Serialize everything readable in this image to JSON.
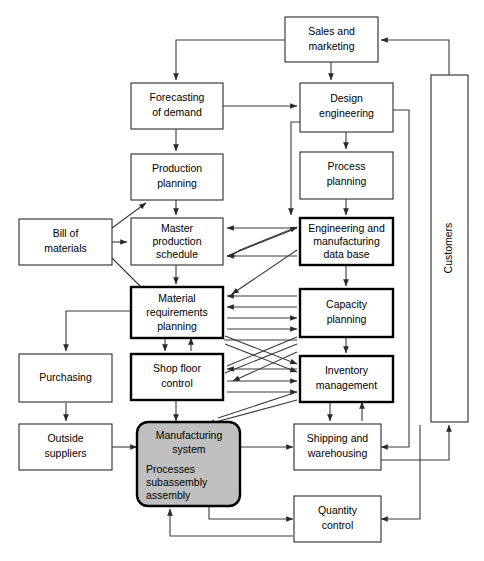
{
  "figure": {
    "background_color": "#ffffff",
    "line_color": "#3a3a3a",
    "shaded_fill": "#bfbfbf"
  },
  "nodes": {
    "sales_marketing": {
      "label_line1": "Sales and",
      "label_line2": "marketing",
      "border": "thin"
    },
    "forecasting": {
      "label_line1": "Forecasting",
      "label_line2": "of demand",
      "border": "thin"
    },
    "design_engineering": {
      "label_line1": "Design",
      "label_line2": "engineering",
      "border": "thin"
    },
    "production_planning": {
      "label_line1": "Production",
      "label_line2": "planning",
      "border": "thin"
    },
    "process_planning": {
      "label_line1": "Process",
      "label_line2": "planning",
      "border": "thin"
    },
    "bill_of_materials": {
      "label_line1": "Bill of",
      "label_line2": "materials",
      "border": "thin"
    },
    "master_production_schedule": {
      "label_line1": "Master",
      "label_line2": "production",
      "label_line3": "schedule",
      "border": "thin"
    },
    "engineering_database": {
      "label_line1": "Engineering and",
      "label_line2": "manufacturing",
      "label_line3": "data base",
      "border": "thick"
    },
    "material_requirements_planning": {
      "label_line1": "Material",
      "label_line2": "requirements",
      "label_line3": "planning",
      "border": "thick"
    },
    "capacity_planning": {
      "label_line1": "Capacity",
      "label_line2": "planning",
      "border": "thick"
    },
    "purchasing": {
      "label_line1": "Purchasing",
      "border": "thin"
    },
    "shop_floor_control": {
      "label_line1": "Shop floor",
      "label_line2": "control",
      "border": "thick"
    },
    "inventory_management": {
      "label_line1": "Inventory",
      "label_line2": "management",
      "border": "thick"
    },
    "outside_suppliers": {
      "label_line1": "Outside",
      "label_line2": "suppliers",
      "border": "thin"
    },
    "manufacturing_system": {
      "label_line1": "Manufacturing",
      "label_line2": "system",
      "detail_line1": "Processes",
      "detail_line2": "subassembly",
      "detail_line3": "assembly",
      "border": "thick-rounded-shaded"
    },
    "shipping_warehousing": {
      "label_line1": "Shipping and",
      "label_line2": "warehousing",
      "border": "thin"
    },
    "quantity_control": {
      "label_line1": "Quantity",
      "label_line2": "control",
      "border": "thin"
    },
    "customers": {
      "label_line1": "Customers",
      "border": "thin",
      "orientation": "vertical"
    }
  }
}
